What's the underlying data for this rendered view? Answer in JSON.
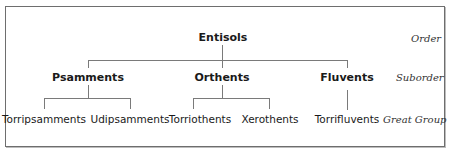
{
  "diagram": {
    "type": "taxonomy-tree",
    "levels": {
      "order": "Order",
      "suborder": "Suborder",
      "great_group": "Great Group"
    },
    "order": {
      "label": "Entisols"
    },
    "suborders": [
      {
        "label": "Psamments",
        "great_groups": [
          {
            "label": "Torripsamments"
          },
          {
            "label": "Udipsamments"
          }
        ]
      },
      {
        "label": "Orthents",
        "great_groups": [
          {
            "label": "Torriothents"
          },
          {
            "label": "Xerothents"
          }
        ]
      },
      {
        "label": "Fluvents",
        "great_groups": [
          {
            "label": "Torrifluvents"
          }
        ]
      }
    ]
  }
}
